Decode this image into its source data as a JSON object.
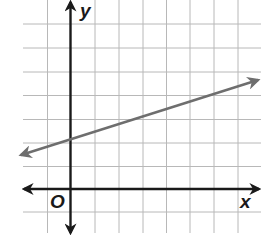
{
  "graph": {
    "x_axis_label": "x",
    "y_axis_label": "y",
    "origin_label": "O",
    "grid": {
      "x_min_units": -2,
      "x_max_units": 7,
      "y_min_units": -1,
      "y_max_units": 7,
      "spacing_px": 23.7
    },
    "line": {
      "slope": "1/3",
      "y_intercept": 2,
      "color": "#6e6e6e",
      "arrows": "both ends"
    },
    "colors": {
      "grid": "#b8b8b8",
      "axes": "#1a1a1a",
      "background": "#ffffff"
    }
  }
}
